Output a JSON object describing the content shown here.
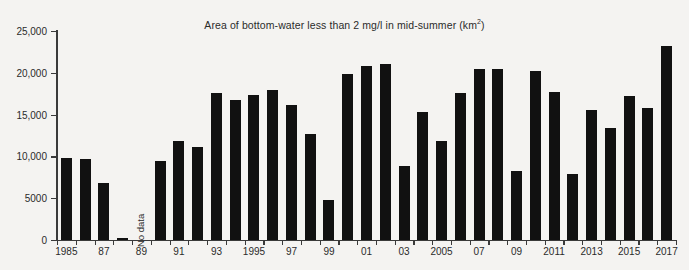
{
  "chart_data": {
    "type": "bar",
    "title": "Area of bottom-water less than 2 mg/l in mid-summer (km2)",
    "title_main": "Area of bottom-water less than 2 mg/l in mid-summer (km",
    "title_sup": "2",
    "title_tail": ")",
    "xlabel": "",
    "ylabel": "",
    "ylim": [
      0,
      25000
    ],
    "grid": false,
    "legend": "none",
    "ytick_values": [
      0,
      5000,
      10000,
      15000,
      20000,
      25000
    ],
    "ytick_labels": [
      "0",
      "5000",
      "10,000",
      "15,000",
      "20,000",
      "25,000"
    ],
    "categories": [
      1985,
      1986,
      1987,
      1988,
      1989,
      1990,
      1991,
      1992,
      1993,
      1994,
      1995,
      1996,
      1997,
      1998,
      1999,
      2000,
      2001,
      2002,
      2003,
      2004,
      2005,
      2006,
      2007,
      2008,
      2009,
      2010,
      2011,
      2012,
      2013,
      2014,
      2015,
      2016,
      2017
    ],
    "xtick_labels": [
      {
        "year": 1985,
        "label": "1985"
      },
      {
        "year": 1987,
        "label": "87"
      },
      {
        "year": 1989,
        "label": "89"
      },
      {
        "year": 1991,
        "label": "91"
      },
      {
        "year": 1993,
        "label": "93"
      },
      {
        "year": 1995,
        "label": "1995"
      },
      {
        "year": 1997,
        "label": "97"
      },
      {
        "year": 1999,
        "label": "99"
      },
      {
        "year": 2001,
        "label": "01"
      },
      {
        "year": 2003,
        "label": "03"
      },
      {
        "year": 2005,
        "label": "2005"
      },
      {
        "year": 2007,
        "label": "07"
      },
      {
        "year": 2009,
        "label": "09"
      },
      {
        "year": 2011,
        "label": "2011"
      },
      {
        "year": 2013,
        "label": "2013"
      },
      {
        "year": 2015,
        "label": "2015"
      },
      {
        "year": 2017,
        "label": "2017"
      }
    ],
    "values": [
      9800,
      9700,
      6800,
      250,
      null,
      9400,
      11900,
      11100,
      17600,
      16700,
      17300,
      18000,
      16200,
      12700,
      4800,
      19900,
      20800,
      21000,
      8800,
      15300,
      11900,
      17600,
      20500,
      20500,
      8200,
      20200,
      17700,
      7900,
      15500,
      13400,
      17200,
      15800,
      23200
    ],
    "annotations": [
      {
        "text": "No data",
        "year": 1989,
        "orientation": "vertical"
      }
    ],
    "bar_color": "#111111",
    "axis_color": "#3a3a3a",
    "background_color": "#f4f3f1"
  }
}
